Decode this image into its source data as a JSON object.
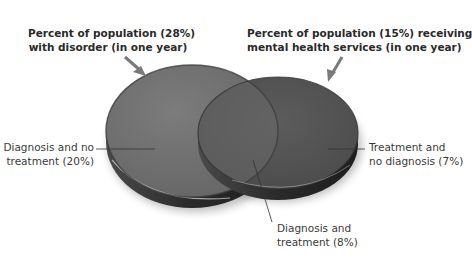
{
  "diagram": {
    "type": "venn",
    "colors": {
      "left_disc": "#6f6f6f",
      "right_disc": "#545454",
      "overlap": "#5e5e5e",
      "rim": "#2e2e2e",
      "text": "#3a3a3a",
      "arrow": "#7a7a7a"
    },
    "sets": [
      {
        "id": "disorder",
        "label_line1": "Percent of population (28%)",
        "label_line2": "with disorder (in one year)",
        "percent": 28
      },
      {
        "id": "services",
        "label_line1": "Percent of population (15%) receiving",
        "label_line2": "mental health services (in one year)",
        "percent": 15
      }
    ],
    "regions": [
      {
        "id": "diagnosis-no-treatment",
        "label_line1": "Diagnosis and no",
        "label_line2": "treatment (20%)",
        "percent": 20
      },
      {
        "id": "treatment-no-diagnosis",
        "label_line1": "Treatment and",
        "label_line2": "no diagnosis (7%)",
        "percent": 7
      },
      {
        "id": "diagnosis-and-treatment",
        "label_line1": "Diagnosis and",
        "label_line2": "treatment (8%)",
        "percent": 8
      }
    ]
  }
}
